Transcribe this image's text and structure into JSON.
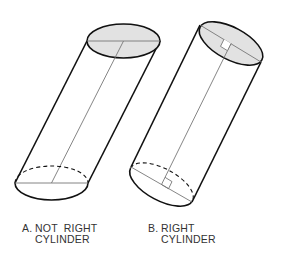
{
  "figure": {
    "cylinder_a": {
      "letter": "A.",
      "line1": "NOT  RIGHT",
      "line2": "CYLINDER",
      "right_angle_marks": false
    },
    "cylinder_b": {
      "letter": "B.",
      "line1": "RIGHT",
      "line2": "CYLINDER",
      "right_angle_marks": true
    },
    "colors": {
      "stroke": "#111111",
      "base_fill": "#e2e2e2",
      "thin_line": "#777777"
    }
  }
}
